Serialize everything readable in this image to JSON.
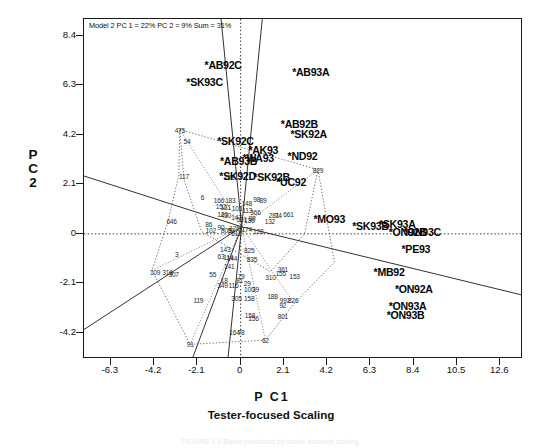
{
  "figure": {
    "title_box": "Model 2 PC 1 = 22%  PC 2 = 9%  Sum = 31%",
    "xlabel_pre": "P C",
    "xlabel_post": "1",
    "ylabel_line1": "P",
    "ylabel_line2": "C",
    "ylabel_line3": "2",
    "subtitle": "Tester-focused Scaling",
    "caption": "FIGURE 1.1  Biplot produced by tester-focused scaling.",
    "axis_color": "#1a1a1a",
    "point_color": "#050505",
    "hull_color": "#555555"
  },
  "chart_data": {
    "type": "scatter",
    "title": "Model 2 PC 1 = 22%  PC 2 = 9%  Sum = 31%",
    "subtitle": "Tester-focused Scaling",
    "xlabel": "P C 1",
    "ylabel": "P C 2",
    "xlim": [
      -7.6,
      13.7
    ],
    "ylim": [
      -5.3,
      9.1
    ],
    "xticks": [
      -6.3,
      -4.2,
      -2.1,
      0,
      2.1,
      4.2,
      6.3,
      8.4,
      10.5,
      12.6
    ],
    "yticks": [
      -4.2,
      -2.1,
      0,
      2.1,
      4.2,
      6.3,
      8.4
    ],
    "grid": false,
    "legend": "none",
    "reference_lines": {
      "horizontal_at_y": 0,
      "vertical_at_x": 0,
      "style": "dotted"
    },
    "environment_points": [
      {
        "label": "*AB92C",
        "x": -0.85,
        "y": 7.15
      },
      {
        "label": "*SK93C",
        "x": -1.75,
        "y": 6.45
      },
      {
        "label": "*AB93A",
        "x": 3.4,
        "y": 6.85
      },
      {
        "label": "*AB92B",
        "x": 2.85,
        "y": 4.65
      },
      {
        "label": "*SK92A",
        "x": 3.3,
        "y": 4.25
      },
      {
        "label": "*SK92C",
        "x": -0.25,
        "y": 3.95
      },
      {
        "label": "*AK93",
        "x": 1.1,
        "y": 3.55
      },
      {
        "label": "*ND92",
        "x": 3.0,
        "y": 3.3
      },
      {
        "label": "*AB93B",
        "x": -0.1,
        "y": 3.1
      },
      {
        "label": "*WA93",
        "x": 0.85,
        "y": 3.2
      },
      {
        "label": "*SK92D",
        "x": -0.15,
        "y": 2.45
      },
      {
        "label": "*SK92B",
        "x": 1.5,
        "y": 2.4
      },
      {
        "label": "*UC92",
        "x": 2.45,
        "y": 2.2
      },
      {
        "label": "*MO93",
        "x": 4.3,
        "y": 0.62
      },
      {
        "label": "*SK93B",
        "x": 6.3,
        "y": 0.33
      },
      {
        "label": "*SK93A",
        "x": 7.6,
        "y": 0.42
      },
      {
        "label": "*ON92B",
        "x": 8.1,
        "y": 0.1
      },
      {
        "label": "*ON93C",
        "x": 8.8,
        "y": 0.08
      },
      {
        "label": "*PE93",
        "x": 8.5,
        "y": -0.62
      },
      {
        "label": "*MB92",
        "x": 7.2,
        "y": -1.62
      },
      {
        "label": "*ON92A",
        "x": 8.4,
        "y": -2.35
      },
      {
        "label": "*ON93A",
        "x": 8.1,
        "y": -3.05
      },
      {
        "label": "*ON93B",
        "x": 8.0,
        "y": -3.42
      }
    ],
    "genotype_points": [
      {
        "label": "475",
        "x": -2.95,
        "y": 4.42
      },
      {
        "label": "54",
        "x": -2.6,
        "y": 3.92
      },
      {
        "label": "117",
        "x": -2.75,
        "y": 2.45
      },
      {
        "label": "128",
        "x": -0.55,
        "y": 2.42
      },
      {
        "label": "829",
        "x": 3.75,
        "y": 2.72
      },
      {
        "label": "6",
        "x": -1.85,
        "y": 1.58
      },
      {
        "label": "166",
        "x": -1.05,
        "y": 1.45
      },
      {
        "label": "183",
        "x": -0.5,
        "y": 1.42
      },
      {
        "label": "148",
        "x": 0.3,
        "y": 1.3
      },
      {
        "label": "98",
        "x": 0.78,
        "y": 1.48
      },
      {
        "label": "89",
        "x": 1.08,
        "y": 1.45
      },
      {
        "label": "152",
        "x": -0.95,
        "y": 1.18
      },
      {
        "label": "131",
        "x": -0.72,
        "y": 1.12
      },
      {
        "label": "103",
        "x": -0.18,
        "y": 1.08
      },
      {
        "label": "113",
        "x": 0.32,
        "y": 1.02
      },
      {
        "label": "366",
        "x": 0.72,
        "y": 0.92
      },
      {
        "label": "281",
        "x": 1.62,
        "y": 0.82
      },
      {
        "label": "74",
        "x": 1.82,
        "y": 0.8
      },
      {
        "label": "661",
        "x": 2.32,
        "y": 0.86
      },
      {
        "label": "120",
        "x": -0.88,
        "y": 0.86
      },
      {
        "label": "430",
        "x": -0.72,
        "y": 0.78
      },
      {
        "label": "147",
        "x": -0.2,
        "y": 0.72
      },
      {
        "label": "89",
        "x": 0.55,
        "y": 0.68
      },
      {
        "label": "132",
        "x": 1.42,
        "y": 0.56
      },
      {
        "label": "501",
        "x": 0.05,
        "y": 0.62
      },
      {
        "label": "136",
        "x": 0.42,
        "y": 0.6
      },
      {
        "label": "646",
        "x": -3.35,
        "y": 0.54
      },
      {
        "label": "86",
        "x": -1.55,
        "y": 0.4
      },
      {
        "label": "102",
        "x": -1.45,
        "y": 0.18
      },
      {
        "label": "90",
        "x": -0.95,
        "y": 0.28
      },
      {
        "label": "51",
        "x": -0.45,
        "y": 0.18
      },
      {
        "label": "808",
        "x": -0.7,
        "y": 0.18
      },
      {
        "label": "176",
        "x": -0.3,
        "y": 0.25
      },
      {
        "label": "174",
        "x": 0.3,
        "y": 0.2
      },
      {
        "label": "128",
        "x": 0.85,
        "y": 0.12
      },
      {
        "label": "512",
        "x": -0.2,
        "y": 0.05
      },
      {
        "label": "143",
        "x": -0.75,
        "y": -0.62
      },
      {
        "label": "3",
        "x": -3.1,
        "y": -0.85
      },
      {
        "label": "63",
        "x": -0.95,
        "y": -0.95
      },
      {
        "label": "114",
        "x": -0.6,
        "y": -1.0
      },
      {
        "label": "144",
        "x": -0.42,
        "y": -1.02
      },
      {
        "label": "825",
        "x": 0.42,
        "y": -0.7
      },
      {
        "label": "835",
        "x": 0.55,
        "y": -1.05
      },
      {
        "label": "141",
        "x": -0.55,
        "y": -1.35
      },
      {
        "label": "109",
        "x": -4.15,
        "y": -1.62
      },
      {
        "label": "316",
        "x": -3.55,
        "y": -1.62
      },
      {
        "label": "307",
        "x": -3.25,
        "y": -1.72
      },
      {
        "label": "55",
        "x": -1.35,
        "y": -1.72
      },
      {
        "label": "18",
        "x": -0.8,
        "y": -1.95
      },
      {
        "label": "81",
        "x": -0.05,
        "y": -1.95
      },
      {
        "label": "349",
        "x": -0.88,
        "y": -2.18
      },
      {
        "label": "116",
        "x": -0.35,
        "y": -2.15
      },
      {
        "label": "79",
        "x": 0.02,
        "y": -1.78
      },
      {
        "label": "29",
        "x": 0.32,
        "y": -2.08
      },
      {
        "label": "310",
        "x": 1.45,
        "y": -1.82
      },
      {
        "label": "155",
        "x": 1.95,
        "y": -1.66
      },
      {
        "label": "361",
        "x": 2.05,
        "y": -1.48
      },
      {
        "label": "153",
        "x": 2.62,
        "y": -1.78
      },
      {
        "label": "100",
        "x": 0.42,
        "y": -2.35
      },
      {
        "label": "39",
        "x": 0.72,
        "y": -2.35
      },
      {
        "label": "119",
        "x": -2.05,
        "y": -2.78
      },
      {
        "label": "158",
        "x": 0.42,
        "y": -2.72
      },
      {
        "label": "305",
        "x": -0.2,
        "y": -2.72
      },
      {
        "label": "188",
        "x": 1.55,
        "y": -2.62
      },
      {
        "label": "992",
        "x": 2.15,
        "y": -2.82
      },
      {
        "label": "826",
        "x": 2.55,
        "y": -2.82
      },
      {
        "label": "92",
        "x": 2.05,
        "y": -3.02
      },
      {
        "label": "801",
        "x": 2.05,
        "y": -3.48
      },
      {
        "label": "158",
        "x": 0.45,
        "y": -3.45
      },
      {
        "label": "156",
        "x": 0.62,
        "y": -3.55
      },
      {
        "label": "164",
        "x": -0.3,
        "y": -4.15
      },
      {
        "label": "78",
        "x": 0.02,
        "y": -4.15
      },
      {
        "label": "91",
        "x": -2.45,
        "y": -4.68
      },
      {
        "label": "62",
        "x": 1.2,
        "y": -4.5
      }
    ]
  }
}
